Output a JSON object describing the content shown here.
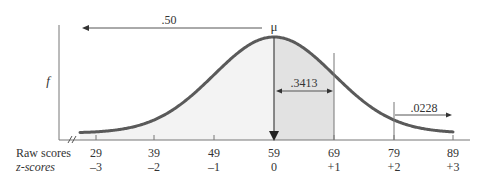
{
  "chart_data": {
    "type": "area",
    "title": "",
    "xlabel": "Raw scores / z-scores",
    "ylabel": "f",
    "mean_label": "μ",
    "mean": 59,
    "sd": 10,
    "raw_scores": [
      "29",
      "39",
      "49",
      "59",
      "69",
      "79",
      "89"
    ],
    "z_scores": [
      "–3",
      "–2",
      "–1",
      "0",
      "+1",
      "+2",
      "+3"
    ],
    "row_labels": {
      "raw": "Raw scores",
      "z": "z-scores"
    },
    "annotations": [
      {
        "label": ".50",
        "region": "left of mean",
        "from_z": null,
        "to_z": 0
      },
      {
        "label": ".3413",
        "region": "between mean and +1",
        "from_z": 0,
        "to_z": 1
      },
      {
        "label": ".0228",
        "region": "beyond +2",
        "from_z": 2,
        "to_z": null
      }
    ],
    "axis_break": true,
    "grid": false,
    "colors": {
      "curve": "#555555",
      "shade_light": "#f3f3f3",
      "shade_dark": "#e3e3e3",
      "axis": "#777777",
      "text": "#333333"
    }
  }
}
